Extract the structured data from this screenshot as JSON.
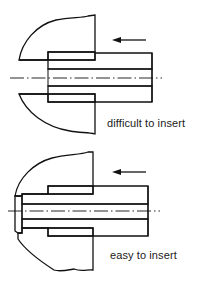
{
  "figures": [
    {
      "id": "top",
      "caption": "difficult to insert",
      "description": "Pin inserted into housing bore without lead-in chamfer",
      "arrow_direction": "left"
    },
    {
      "id": "bottom",
      "caption": "easy to insert",
      "description": "Pin with guiding/pilot section entering housing bore first",
      "arrow_direction": "left"
    }
  ],
  "colors": {
    "line": "#111111",
    "background": "#ffffff"
  }
}
